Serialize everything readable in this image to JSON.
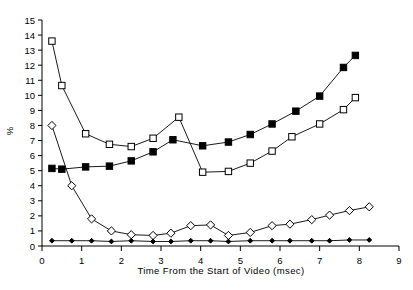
{
  "chart_data": {
    "type": "line",
    "title": "",
    "xlabel": "Time From the Start of Video (msec)",
    "ylabel": "%",
    "xlim": [
      0,
      9
    ],
    "ylim": [
      0,
      15
    ],
    "xticks": [
      0,
      1,
      2,
      3,
      4,
      5,
      6,
      7,
      8,
      9
    ],
    "yticks": [
      0,
      1,
      2,
      3,
      4,
      5,
      6,
      7,
      8,
      9,
      10,
      11,
      12,
      13,
      14,
      15
    ],
    "grid": false,
    "legend": "none",
    "series": [
      {
        "name": "open-square-series",
        "marker": "open-square",
        "color": "#000000",
        "points": [
          {
            "x": 0.25,
            "y": 13.6
          },
          {
            "x": 0.5,
            "y": 10.65
          },
          {
            "x": 1.1,
            "y": 7.45
          },
          {
            "x": 1.7,
            "y": 6.75
          },
          {
            "x": 2.25,
            "y": 6.6
          },
          {
            "x": 2.8,
            "y": 7.15
          },
          {
            "x": 3.45,
            "y": 8.55
          },
          {
            "x": 4.05,
            "y": 4.9
          },
          {
            "x": 4.7,
            "y": 4.95
          },
          {
            "x": 5.25,
            "y": 5.5
          },
          {
            "x": 5.8,
            "y": 6.3
          },
          {
            "x": 6.3,
            "y": 7.25
          },
          {
            "x": 7.0,
            "y": 8.1
          },
          {
            "x": 7.6,
            "y": 9.05
          },
          {
            "x": 7.9,
            "y": 9.85
          }
        ]
      },
      {
        "name": "filled-square-series",
        "marker": "filled-square",
        "color": "#000000",
        "points": [
          {
            "x": 0.25,
            "y": 5.15
          },
          {
            "x": 0.5,
            "y": 5.1
          },
          {
            "x": 1.1,
            "y": 5.25
          },
          {
            "x": 1.7,
            "y": 5.3
          },
          {
            "x": 2.25,
            "y": 5.65
          },
          {
            "x": 2.8,
            "y": 6.25
          },
          {
            "x": 3.3,
            "y": 7.05
          },
          {
            "x": 4.05,
            "y": 6.65
          },
          {
            "x": 4.7,
            "y": 6.9
          },
          {
            "x": 5.25,
            "y": 7.4
          },
          {
            "x": 5.8,
            "y": 8.1
          },
          {
            "x": 6.4,
            "y": 8.95
          },
          {
            "x": 7.0,
            "y": 9.95
          },
          {
            "x": 7.6,
            "y": 11.85
          },
          {
            "x": 7.9,
            "y": 12.65
          }
        ]
      },
      {
        "name": "open-diamond-series",
        "marker": "open-diamond",
        "color": "#000000",
        "points": [
          {
            "x": 0.25,
            "y": 8.0
          },
          {
            "x": 0.75,
            "y": 4.0
          },
          {
            "x": 1.25,
            "y": 1.8
          },
          {
            "x": 1.75,
            "y": 1.0
          },
          {
            "x": 2.25,
            "y": 0.75
          },
          {
            "x": 2.8,
            "y": 0.7
          },
          {
            "x": 3.25,
            "y": 0.85
          },
          {
            "x": 3.75,
            "y": 1.35
          },
          {
            "x": 4.25,
            "y": 1.4
          },
          {
            "x": 4.7,
            "y": 0.7
          },
          {
            "x": 5.25,
            "y": 0.9
          },
          {
            "x": 5.8,
            "y": 1.35
          },
          {
            "x": 6.25,
            "y": 1.45
          },
          {
            "x": 6.8,
            "y": 1.75
          },
          {
            "x": 7.25,
            "y": 2.05
          },
          {
            "x": 7.75,
            "y": 2.35
          },
          {
            "x": 8.25,
            "y": 2.6
          }
        ]
      },
      {
        "name": "filled-diamond-series",
        "marker": "filled-diamond",
        "color": "#000000",
        "points": [
          {
            "x": 0.25,
            "y": 0.35
          },
          {
            "x": 0.75,
            "y": 0.35
          },
          {
            "x": 1.25,
            "y": 0.35
          },
          {
            "x": 1.75,
            "y": 0.3
          },
          {
            "x": 2.25,
            "y": 0.35
          },
          {
            "x": 2.8,
            "y": 0.3
          },
          {
            "x": 3.25,
            "y": 0.3
          },
          {
            "x": 3.75,
            "y": 0.35
          },
          {
            "x": 4.25,
            "y": 0.35
          },
          {
            "x": 4.7,
            "y": 0.3
          },
          {
            "x": 5.25,
            "y": 0.35
          },
          {
            "x": 5.8,
            "y": 0.35
          },
          {
            "x": 6.25,
            "y": 0.35
          },
          {
            "x": 6.8,
            "y": 0.35
          },
          {
            "x": 7.25,
            "y": 0.35
          },
          {
            "x": 7.75,
            "y": 0.4
          },
          {
            "x": 8.25,
            "y": 0.4
          }
        ]
      }
    ]
  },
  "axes": {
    "x_title": "Time From the Start of Video (msec)",
    "y_title": "%"
  }
}
